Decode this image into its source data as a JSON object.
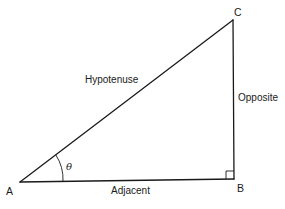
{
  "diagram": {
    "type": "right-triangle",
    "stroke_color": "#1a1a1a",
    "background": "#ffffff",
    "vertices": {
      "A": {
        "label": "A",
        "x": 20,
        "y": 182
      },
      "B": {
        "label": "B",
        "x": 234,
        "y": 179
      },
      "C": {
        "label": "C",
        "x": 233,
        "y": 20
      }
    },
    "sides": {
      "hypotenuse": "Hypotenuse",
      "opposite": "Opposite",
      "adjacent": "Adjacent"
    },
    "angle": {
      "symbol": "θ",
      "at_vertex": "A"
    },
    "right_angle_at": "B"
  }
}
